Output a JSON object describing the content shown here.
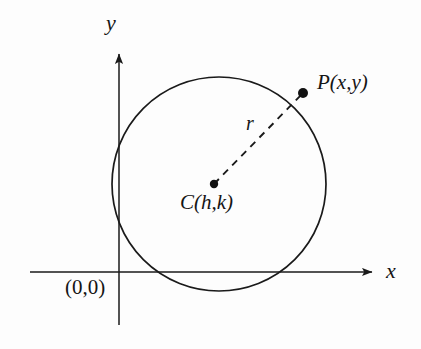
{
  "figure": {
    "background_color": "#fdfdfd",
    "stroke_color": "#1a1a1a",
    "text_color": "#151515",
    "canvas": {
      "width": 421,
      "height": 349
    }
  },
  "axes": {
    "x_axis": {
      "label": "x",
      "y_position": 272,
      "x_start": 30,
      "x_end": 378,
      "arrow": "right"
    },
    "y_axis": {
      "label": "y",
      "x_position": 119,
      "y_start": 325,
      "y_end": 48,
      "arrow": "up"
    },
    "origin_label": "(0,0)"
  },
  "circle": {
    "center_x": 219,
    "center_y": 184,
    "radius": 107,
    "stroke_width": 1.6
  },
  "points": [
    {
      "id": "center",
      "label": "C(h,k)",
      "x": 214,
      "y": 184,
      "dot_radius": 4.2
    },
    {
      "id": "point-p",
      "label": "P(x,y)",
      "x": 303,
      "y": 93,
      "dot_radius": 5.0
    }
  ],
  "radius_segment": {
    "label": "r",
    "from_x": 214,
    "from_y": 184,
    "to_x": 303,
    "to_y": 93,
    "style": "dashed",
    "dash_pattern": "7 6"
  }
}
